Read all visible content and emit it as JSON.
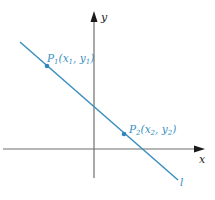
{
  "diagram": {
    "axes": {
      "x_label": "x",
      "y_label": "y"
    },
    "line": {
      "label": "l",
      "color": "#3a8fbf"
    },
    "points": [
      {
        "name": "P",
        "sub": "1",
        "coords_text": "(x",
        "x_sub": "1",
        "mid": ", y",
        "y_sub": "1",
        "close": ")"
      },
      {
        "name": "P",
        "sub": "2",
        "coords_text": "(x",
        "x_sub": "2",
        "mid": ", y",
        "y_sub": "2",
        "close": ")"
      }
    ]
  }
}
